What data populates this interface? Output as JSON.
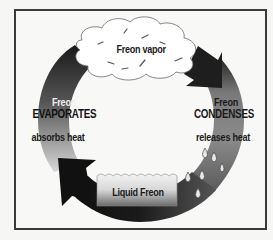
{
  "diagram": {
    "type": "refrigeration-cycle",
    "title": "",
    "stages": {
      "top": {
        "label": "Freon vapor",
        "shape": "cloud"
      },
      "right": {
        "line1": "Freon",
        "line2": "CONDENSES",
        "line3": "releases heat"
      },
      "bottom": {
        "label": "Liquid Freon",
        "shape": "liquid-box"
      },
      "left": {
        "line1": "Freon",
        "line2": "EVAPORATES",
        "line3": "absorbs heat"
      }
    },
    "flow_direction": "clockwise",
    "colors": {
      "frame": "#3a3a3a",
      "arrow_dark": "#1a1a1a",
      "arrow_mid": "#6a6a6a",
      "arrow_light": "#c8c8c8",
      "background": "#f8f8f6"
    }
  }
}
